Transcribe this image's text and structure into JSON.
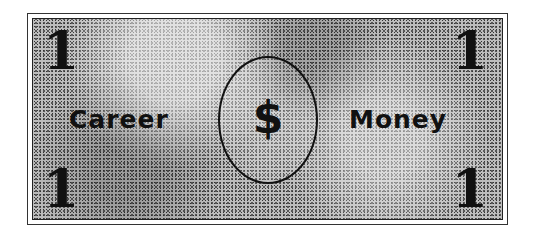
{
  "bill": {
    "denomination": "1",
    "left_word": "Career",
    "right_word": "Money",
    "seal_symbol": "$"
  }
}
